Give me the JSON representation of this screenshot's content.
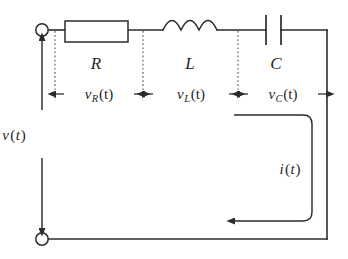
{
  "figure": {
    "name": "series-rlc-circuit",
    "background_color": "#ffffff",
    "line_color": "#2b2b2b",
    "dotted_color": "#5c5c5c",
    "width": 348,
    "height": 259
  },
  "components": {
    "resistor": {
      "label": "R",
      "type": "resistor",
      "shape": "rectangle"
    },
    "inductor": {
      "label": "L",
      "type": "inductor",
      "shape": "three-arc-coil",
      "coil_count": 3
    },
    "capacitor": {
      "label": "C",
      "type": "capacitor",
      "shape": "two-parallel-plates"
    }
  },
  "source": {
    "label_v": "v",
    "label_paren_open": "(",
    "label_t": "t",
    "label_paren_close": ")",
    "label_full": "v(t)",
    "arrow_style": "double-headed-vertical"
  },
  "current": {
    "label_i": "i",
    "label_paren_open": "(",
    "label_t": "t",
    "label_paren_close": ")",
    "label_full": "i(t)",
    "direction": "counterclockwise-arrow-pointing-left"
  },
  "voltages": [
    {
      "key": "v_R",
      "symbol": "v",
      "subscript": "R",
      "arg": "(t)",
      "label_full": "vR(t)",
      "across": "resistor"
    },
    {
      "key": "v_L",
      "symbol": "v",
      "subscript": "L",
      "arg": "(t)",
      "label_full": "vL(t)",
      "across": "inductor"
    },
    {
      "key": "v_C",
      "symbol": "v",
      "subscript": "C",
      "arg": "(t)",
      "label_full": "vC(t)",
      "across": "capacitor"
    }
  ],
  "terminals": [
    {
      "name": "top-terminal",
      "position": "top-left"
    },
    {
      "name": "bottom-terminal",
      "position": "bottom-left"
    }
  ]
}
